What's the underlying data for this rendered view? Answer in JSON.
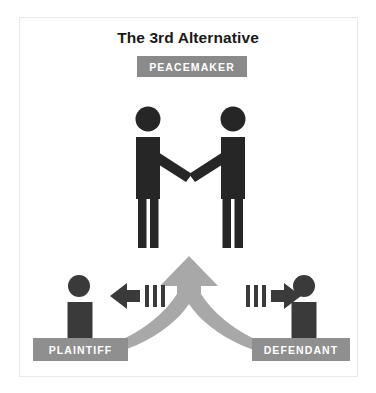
{
  "diagram": {
    "title": "The 3rd Alternative",
    "center_badge": {
      "label": "PEACEMAKER",
      "background_color": "#8a8a8a",
      "text_color": "#ffffff"
    },
    "parties": [
      {
        "id": "plaintiff",
        "label": "PLAINTIFF",
        "side": "left",
        "background_color": "#8f8f8f",
        "text_color": "#ffffff"
      },
      {
        "id": "defendant",
        "label": "DEFENDANT",
        "side": "right",
        "background_color": "#8f8f8f",
        "text_color": "#ffffff"
      }
    ],
    "figures": {
      "handshake_pair_color": "#262626",
      "bust_color": "#3a3a3a"
    },
    "arrows": {
      "merge_arrow_color": "#a8a8a8",
      "direction_arrow_color": "#3a3a3a",
      "left_arrow_direction": "left",
      "right_arrow_direction": "right",
      "merge_arrow_direction": "up"
    },
    "border_color": "#e9e9e9",
    "background_color": "#ffffff"
  }
}
